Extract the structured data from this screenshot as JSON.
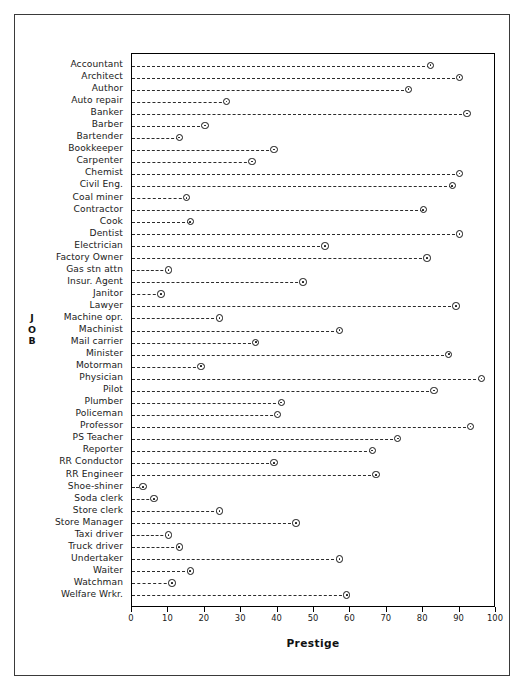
{
  "figure": {
    "xaxis_title": "Prestige",
    "yaxis_title_chars": [
      "J",
      "O",
      "B"
    ]
  },
  "chart_data": {
    "type": "scatter",
    "plot_style": "cleveland-dot-plot",
    "title": "",
    "subtitle": "",
    "xlabel": "Prestige",
    "ylabel": "JOB",
    "xlim": [
      0,
      100
    ],
    "xticks": [
      0,
      10,
      20,
      30,
      40,
      50,
      60,
      70,
      80,
      90,
      100
    ],
    "xtick_labels": [
      "0",
      "10",
      "20",
      "30",
      "40",
      "50",
      "60",
      "70",
      "80",
      "90",
      "100"
    ],
    "grid": false,
    "legend": false,
    "marker": "circle-with-center-dot",
    "leader_line": "dashed",
    "categories": [
      "Accountant",
      "Architect",
      "Author",
      "Auto repair",
      "Banker",
      "Barber",
      "Bartender",
      "Bookkeeper",
      "Carpenter",
      "Chemist",
      "Civil Eng.",
      "Coal miner",
      "Contractor",
      "Cook",
      "Dentist",
      "Electrician",
      "Factory Owner",
      "Gas stn attn",
      "Insur. Agent",
      "Janitor",
      "Lawyer",
      "Machine opr.",
      "Machinist",
      "Mail carrier",
      "Minister",
      "Motorman",
      "Physician",
      "Pilot",
      "Plumber",
      "Policeman",
      "Professor",
      "PS Teacher",
      "Reporter",
      "RR Conductor",
      "RR Engineer",
      "Shoe-shiner",
      "Soda clerk",
      "Store clerk",
      "Store Manager",
      "Taxi driver",
      "Truck driver",
      "Undertaker",
      "Waiter",
      "Watchman",
      "Welfare Wrkr."
    ],
    "values": [
      82,
      90,
      76,
      26,
      92,
      20,
      13,
      39,
      33,
      90,
      88,
      15,
      80,
      16,
      90,
      53,
      81,
      10,
      47,
      8,
      89,
      24,
      57,
      34,
      87,
      19,
      96,
      83,
      41,
      40,
      93,
      73,
      66,
      39,
      67,
      3,
      6,
      24,
      45,
      10,
      13,
      57,
      16,
      11,
      59
    ],
    "series": [
      {
        "name": "Prestige",
        "points": [
          {
            "label": "Accountant",
            "value": 82
          },
          {
            "label": "Architect",
            "value": 90
          },
          {
            "label": "Author",
            "value": 76
          },
          {
            "label": "Auto repair",
            "value": 26
          },
          {
            "label": "Banker",
            "value": 92
          },
          {
            "label": "Barber",
            "value": 20
          },
          {
            "label": "Bartender",
            "value": 13
          },
          {
            "label": "Bookkeeper",
            "value": 39
          },
          {
            "label": "Carpenter",
            "value": 33
          },
          {
            "label": "Chemist",
            "value": 90
          },
          {
            "label": "Civil Eng.",
            "value": 88
          },
          {
            "label": "Coal miner",
            "value": 15
          },
          {
            "label": "Contractor",
            "value": 80
          },
          {
            "label": "Cook",
            "value": 16
          },
          {
            "label": "Dentist",
            "value": 90
          },
          {
            "label": "Electrician",
            "value": 53
          },
          {
            "label": "Factory Owner",
            "value": 81
          },
          {
            "label": "Gas stn attn",
            "value": 10
          },
          {
            "label": "Insur. Agent",
            "value": 47
          },
          {
            "label": "Janitor",
            "value": 8
          },
          {
            "label": "Lawyer",
            "value": 89
          },
          {
            "label": "Machine opr.",
            "value": 24
          },
          {
            "label": "Machinist",
            "value": 57
          },
          {
            "label": "Mail carrier",
            "value": 34
          },
          {
            "label": "Minister",
            "value": 87
          },
          {
            "label": "Motorman",
            "value": 19
          },
          {
            "label": "Physician",
            "value": 96
          },
          {
            "label": "Pilot",
            "value": 83
          },
          {
            "label": "Plumber",
            "value": 41
          },
          {
            "label": "Policeman",
            "value": 40
          },
          {
            "label": "Professor",
            "value": 93
          },
          {
            "label": "PS Teacher",
            "value": 73
          },
          {
            "label": "Reporter",
            "value": 66
          },
          {
            "label": "RR Conductor",
            "value": 39
          },
          {
            "label": "RR Engineer",
            "value": 67
          },
          {
            "label": "Shoe-shiner",
            "value": 3
          },
          {
            "label": "Soda clerk",
            "value": 6
          },
          {
            "label": "Store clerk",
            "value": 24
          },
          {
            "label": "Store Manager",
            "value": 45
          },
          {
            "label": "Taxi driver",
            "value": 10
          },
          {
            "label": "Truck driver",
            "value": 13
          },
          {
            "label": "Undertaker",
            "value": 57
          },
          {
            "label": "Waiter",
            "value": 16
          },
          {
            "label": "Watchman",
            "value": 11
          },
          {
            "label": "Welfare Wrkr.",
            "value": 59
          }
        ]
      }
    ]
  }
}
